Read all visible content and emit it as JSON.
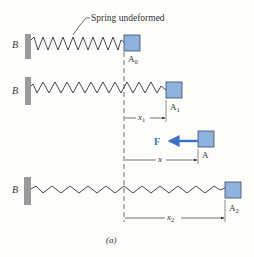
{
  "figure": {
    "caption": "(a)",
    "colors": {
      "block_fill": "#8fb3de",
      "block_stroke": "#3a4a5e",
      "wall": "#9a9a9a",
      "line": "#333333",
      "force": "#3a73c4",
      "background": "#fdfdfb"
    },
    "annotation": {
      "label": "Spring undeformed"
    },
    "rows": [
      {
        "wall_label": "B",
        "block_label": "A",
        "block_sub": "0"
      },
      {
        "wall_label": "B",
        "block_label": "A",
        "block_sub": "1",
        "dimension": {
          "label": "x",
          "sub": "1"
        }
      },
      {
        "block_label": "A",
        "force_label": "F",
        "dimension": {
          "label": "x",
          "sub": ""
        }
      },
      {
        "wall_label": "B",
        "block_label": "A",
        "block_sub": "2",
        "dimension": {
          "label": "x",
          "sub": "2"
        }
      }
    ]
  }
}
